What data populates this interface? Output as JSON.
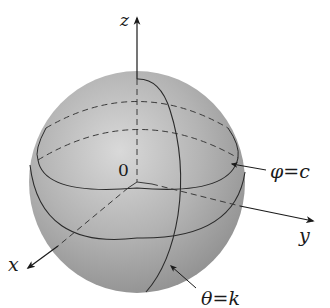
{
  "figure": {
    "axes": {
      "z_label": "z",
      "y_label": "y",
      "x_label": "x",
      "origin_label": "0"
    },
    "annotations": {
      "phi": {
        "symbol": "φ",
        "eq": "=",
        "value": "c"
      },
      "theta": {
        "symbol": "θ",
        "eq": "=",
        "value": "k"
      }
    },
    "colors": {
      "sphere_light": "#d6d6d6",
      "sphere_mid": "#a9a9a9",
      "sphere_dark": "#8c8c8c",
      "line": "#2a2a2a",
      "background": "#ffffff"
    }
  }
}
